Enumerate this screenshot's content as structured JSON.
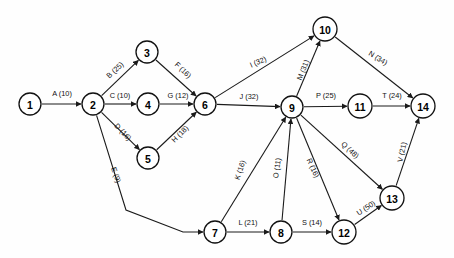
{
  "diagram": {
    "type": "directed-network-graph",
    "title": "",
    "width": 454,
    "height": 258,
    "background_color": "#fefefe",
    "node_fill": "#ffffff",
    "node_stroke": "#111111",
    "edge_color": "#1a1a1a",
    "nodes": [
      {
        "id": "1",
        "label": "1",
        "x": 30,
        "y": 104,
        "r": 11
      },
      {
        "id": "2",
        "label": "2",
        "x": 93,
        "y": 104,
        "r": 11
      },
      {
        "id": "3",
        "label": "3",
        "x": 147,
        "y": 52,
        "r": 11
      },
      {
        "id": "4",
        "label": "4",
        "x": 148,
        "y": 104,
        "r": 11
      },
      {
        "id": "5",
        "label": "5",
        "x": 148,
        "y": 158,
        "r": 11
      },
      {
        "id": "6",
        "label": "6",
        "x": 205,
        "y": 104,
        "r": 11
      },
      {
        "id": "7",
        "label": "7",
        "x": 215,
        "y": 232,
        "r": 11
      },
      {
        "id": "8",
        "label": "8",
        "x": 281,
        "y": 232,
        "r": 11
      },
      {
        "id": "9",
        "label": "9",
        "x": 292,
        "y": 107,
        "r": 11
      },
      {
        "id": "10",
        "label": "10",
        "x": 325,
        "y": 29,
        "r": 12
      },
      {
        "id": "11",
        "label": "11",
        "x": 360,
        "y": 106,
        "r": 12
      },
      {
        "id": "12",
        "label": "12",
        "x": 344,
        "y": 232,
        "r": 12
      },
      {
        "id": "13",
        "label": "13",
        "x": 392,
        "y": 198,
        "r": 12
      },
      {
        "id": "14",
        "label": "14",
        "x": 423,
        "y": 106,
        "r": 12
      }
    ],
    "edges": [
      {
        "name": "A",
        "weight": 10,
        "label": "A (10)",
        "from": "1",
        "to": "2",
        "label_x": 62,
        "label_y": 93,
        "label_rot": 0
      },
      {
        "name": "B",
        "weight": 25,
        "label": "B (25)",
        "from": "2",
        "to": "3",
        "label_x": 115,
        "label_y": 70,
        "label_rot": -43
      },
      {
        "name": "C",
        "weight": 10,
        "label": "C (10)",
        "from": "2",
        "to": "4",
        "label_x": 120,
        "label_y": 95,
        "label_rot": 0
      },
      {
        "name": "D",
        "weight": 16,
        "label": "D (16)",
        "from": "2",
        "to": "5",
        "label_x": 123,
        "label_y": 132,
        "label_rot": 46
      },
      {
        "name": "E",
        "weight": 9,
        "label": "E (9)",
        "from": "2",
        "to": "7",
        "label_x": 116,
        "label_y": 175,
        "label_rot": 70
      },
      {
        "name": "F",
        "weight": 16,
        "label": "F (16)",
        "from": "3",
        "to": "6",
        "label_x": 183,
        "label_y": 70,
        "label_rot": 44
      },
      {
        "name": "G",
        "weight": 12,
        "label": "G (12)",
        "from": "4",
        "to": "6",
        "label_x": 178,
        "label_y": 95,
        "label_rot": 0
      },
      {
        "name": "H",
        "weight": 18,
        "label": "H (18)",
        "from": "5",
        "to": "6",
        "label_x": 180,
        "label_y": 134,
        "label_rot": -45
      },
      {
        "name": "I",
        "weight": 32,
        "label": "I (32)",
        "from": "6",
        "to": "10",
        "label_x": 258,
        "label_y": 62,
        "label_rot": -24
      },
      {
        "name": "J",
        "weight": 32,
        "label": "J (32)",
        "from": "6",
        "to": "9",
        "label_x": 249,
        "label_y": 96,
        "label_rot": 0
      },
      {
        "name": "K",
        "weight": 16,
        "label": "K (16)",
        "from": "7",
        "to": "9",
        "label_x": 240,
        "label_y": 170,
        "label_rot": -72
      },
      {
        "name": "L",
        "weight": 21,
        "label": "L (21)",
        "from": "7",
        "to": "8",
        "label_x": 248,
        "label_y": 222,
        "label_rot": 0
      },
      {
        "name": "M",
        "weight": 31,
        "label": "M (31)",
        "from": "9",
        "to": "10",
        "label_x": 303,
        "label_y": 70,
        "label_rot": -68
      },
      {
        "name": "N",
        "weight": 34,
        "label": "N (34)",
        "from": "10",
        "to": "14",
        "label_x": 378,
        "label_y": 58,
        "label_rot": 31
      },
      {
        "name": "O",
        "weight": 11,
        "label": "O (11)",
        "from": "8",
        "to": "9",
        "label_x": 277,
        "label_y": 168,
        "label_rot": -82
      },
      {
        "name": "P",
        "weight": 25,
        "label": "P (25)",
        "from": "9",
        "to": "11",
        "label_x": 326,
        "label_y": 95,
        "label_rot": 0
      },
      {
        "name": "Q",
        "weight": 48,
        "label": "Q (48)",
        "from": "9",
        "to": "13",
        "label_x": 350,
        "label_y": 150,
        "label_rot": 43
      },
      {
        "name": "R",
        "weight": 16,
        "label": "R (16)",
        "from": "9",
        "to": "12",
        "label_x": 313,
        "label_y": 168,
        "label_rot": 65
      },
      {
        "name": "S",
        "weight": 14,
        "label": "S (14)",
        "from": "8",
        "to": "12",
        "label_x": 312,
        "label_y": 222,
        "label_rot": 0
      },
      {
        "name": "T",
        "weight": 24,
        "label": "T (24)",
        "from": "11",
        "to": "14",
        "label_x": 392,
        "label_y": 95,
        "label_rot": 0
      },
      {
        "name": "U",
        "weight": 50,
        "label": "U (50)",
        "from": "12",
        "to": "13",
        "label_x": 366,
        "label_y": 208,
        "label_rot": -34
      },
      {
        "name": "V",
        "weight": 21,
        "label": "V (21)",
        "from": "13",
        "to": "14",
        "label_x": 402,
        "label_y": 152,
        "label_rot": -78
      }
    ],
    "bent_edges": [
      {
        "name": "E",
        "from": "2",
        "to": "7",
        "waypoints": [
          [
            93,
            104
          ],
          [
            126,
            210
          ],
          [
            183,
            232
          ],
          [
            215,
            232
          ]
        ]
      }
    ]
  }
}
